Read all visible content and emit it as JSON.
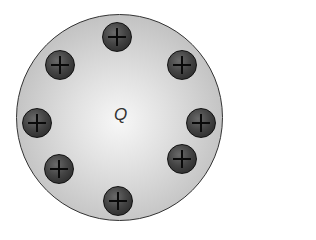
{
  "diagram": {
    "label": "Q",
    "sphere": {
      "cx": 120,
      "cy": 118,
      "r": 104,
      "color": "#c4c4c4"
    },
    "charges": [
      {
        "sign": "+",
        "x": 117,
        "y": 37
      },
      {
        "sign": "+",
        "x": 182,
        "y": 65
      },
      {
        "sign": "+",
        "x": 201,
        "y": 123
      },
      {
        "sign": "+",
        "x": 182,
        "y": 159
      },
      {
        "sign": "+",
        "x": 118,
        "y": 201
      },
      {
        "sign": "+",
        "x": 59,
        "y": 169
      },
      {
        "sign": "+",
        "x": 37,
        "y": 123
      },
      {
        "sign": "+",
        "x": 60,
        "y": 65
      }
    ]
  }
}
